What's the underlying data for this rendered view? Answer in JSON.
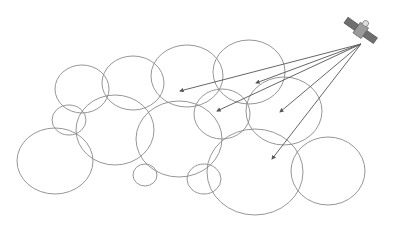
{
  "diagram": {
    "title": "",
    "colors": {
      "circle": "#8a8a8a",
      "beam": "#555555",
      "satellite_body": "#9a9a9a",
      "satellite_panel": "#6f6f6f"
    },
    "satellite": {
      "x": 361,
      "y": 42
    },
    "footprints": [
      {
        "cx": 82,
        "cy": 89,
        "rx": 27,
        "ry": 24
      },
      {
        "cx": 133,
        "cy": 83,
        "rx": 31,
        "ry": 27
      },
      {
        "cx": 187,
        "cy": 76,
        "rx": 36,
        "ry": 31
      },
      {
        "cx": 249,
        "cy": 72,
        "rx": 36,
        "ry": 32
      },
      {
        "cx": 69,
        "cy": 120,
        "rx": 17,
        "ry": 15
      },
      {
        "cx": 115,
        "cy": 130,
        "rx": 39,
        "ry": 35
      },
      {
        "cx": 55,
        "cy": 161,
        "rx": 38,
        "ry": 33
      },
      {
        "cx": 145,
        "cy": 175,
        "rx": 12,
        "ry": 11
      },
      {
        "cx": 179,
        "cy": 139,
        "rx": 43,
        "ry": 38
      },
      {
        "cx": 222,
        "cy": 114,
        "rx": 28,
        "ry": 25
      },
      {
        "cx": 284,
        "cy": 111,
        "rx": 38,
        "ry": 34
      },
      {
        "cx": 255,
        "cy": 172,
        "rx": 48,
        "ry": 43
      },
      {
        "cx": 328,
        "cy": 171,
        "rx": 37,
        "ry": 34
      },
      {
        "cx": 204,
        "cy": 179,
        "rx": 17,
        "ry": 15
      }
    ],
    "beams": [
      {
        "x": 180,
        "y": 91
      },
      {
        "x": 256,
        "y": 83
      },
      {
        "x": 217,
        "y": 111
      },
      {
        "x": 280,
        "y": 112
      },
      {
        "x": 272,
        "y": 159
      }
    ]
  }
}
